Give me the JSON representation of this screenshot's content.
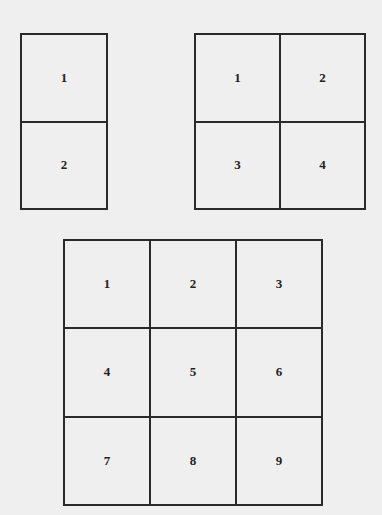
{
  "grids": [
    {
      "name": "grid-1x2",
      "rows": 2,
      "cols": 1,
      "cells": [
        "1",
        "2"
      ]
    },
    {
      "name": "grid-2x2",
      "rows": 2,
      "cols": 2,
      "cells": [
        "1",
        "2",
        "3",
        "4"
      ]
    },
    {
      "name": "grid-3x3",
      "rows": 3,
      "cols": 3,
      "cells": [
        "1",
        "2",
        "3",
        "4",
        "5",
        "6",
        "7",
        "8",
        "9"
      ]
    }
  ],
  "colors": {
    "background": "#efefef",
    "line": "#2a2a2a",
    "text": "#222222"
  }
}
